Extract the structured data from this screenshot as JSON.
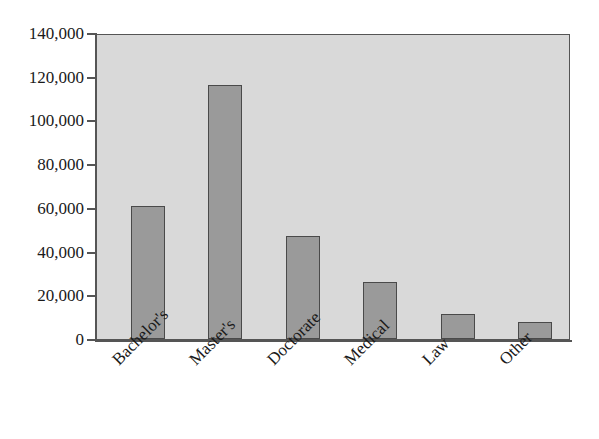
{
  "chart_data": {
    "type": "bar",
    "title": "",
    "subtitle": "",
    "xlabel": "",
    "ylabel": "",
    "categories": [
      "Bachelor's",
      "Master's",
      "Doctorate",
      "Medical",
      "Law",
      "Other"
    ],
    "values": [
      61000,
      116000,
      47000,
      26000,
      11500,
      8000
    ],
    "series": [
      {
        "name": "Degrees",
        "values": [
          61000,
          116000,
          47000,
          26000,
          11500,
          8000
        ]
      }
    ],
    "ylim": [
      0,
      140000
    ],
    "ytick_values": [
      0,
      20000,
      40000,
      60000,
      80000,
      100000,
      120000,
      140000
    ],
    "ytick_labels": [
      "0",
      "20,000",
      "40,000",
      "60,000",
      "80,000",
      "100,000",
      "120,000",
      "140,000"
    ],
    "grid": false,
    "legend": false,
    "legend_position": "none",
    "xtick_rotation": -45,
    "colors": {
      "bar_fill": "#9a9a9a",
      "bar_border": "#4a4a4a",
      "plot_background": "#d9d9d9",
      "axis": "#555555",
      "text": "#1a1a1a",
      "page_background": "#ffffff"
    }
  }
}
